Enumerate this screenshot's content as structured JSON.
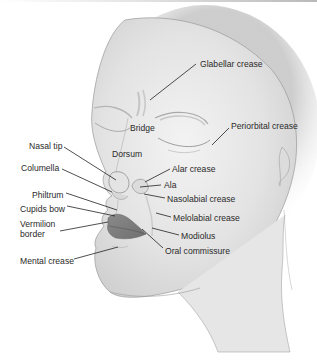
{
  "figure": {
    "labels": [
      {
        "id": "glabellar_crease",
        "text": "Glabellar crease",
        "x": 200,
        "y": 59,
        "lx1": 196,
        "ly1": 64,
        "lx2": 150,
        "ly2": 100
      },
      {
        "id": "bridge",
        "text": "Bridge",
        "x": 130,
        "y": 123,
        "lx1": null
      },
      {
        "id": "periorbital_crease",
        "text": "Periorbital crease",
        "x": 231,
        "y": 121,
        "lx1": 229,
        "ly1": 128,
        "lx2": 212,
        "ly2": 145
      },
      {
        "id": "nasal_tip",
        "text": "Nasal tip",
        "x": 29,
        "y": 141,
        "lx1": 64,
        "ly1": 147,
        "lx2": 116,
        "ly2": 180
      },
      {
        "id": "dorsum",
        "text": "Dorsum",
        "x": 112,
        "y": 149,
        "lx1": null
      },
      {
        "id": "columella",
        "text": "Columella",
        "x": 21,
        "y": 163,
        "lx1": 62,
        "ly1": 169,
        "lx2": 112,
        "ly2": 192
      },
      {
        "id": "alar_crease",
        "text": "Alar crease",
        "x": 172,
        "y": 164,
        "lx1": 170,
        "ly1": 169,
        "lx2": 145,
        "ly2": 182
      },
      {
        "id": "ala",
        "text": "Ala",
        "x": 164,
        "y": 180,
        "lx1": 161,
        "ly1": 185,
        "lx2": 140,
        "ly2": 187
      },
      {
        "id": "philtrum",
        "text": "Philtrum",
        "x": 32,
        "y": 190,
        "lx1": 66,
        "ly1": 193,
        "lx2": 117,
        "ly2": 210
      },
      {
        "id": "nasolabial_crease",
        "text": "Nasolabial crease",
        "x": 167,
        "y": 194,
        "lx1": 165,
        "ly1": 198,
        "lx2": 144,
        "ly2": 194
      },
      {
        "id": "cupids_bow",
        "text": "Cupids bow",
        "x": 20,
        "y": 204,
        "lx1": 67,
        "ly1": 206,
        "lx2": 115,
        "ly2": 216
      },
      {
        "id": "vermilion_border",
        "text": "Vermilion\nborder",
        "x": 20,
        "y": 219,
        "lx1": 60,
        "ly1": 231,
        "lx2": 108,
        "ly2": 222
      },
      {
        "id": "melolabial_crease",
        "text": "Melolabial crease",
        "x": 173,
        "y": 213,
        "lx1": 171,
        "ly1": 217,
        "lx2": 156,
        "ly2": 213
      },
      {
        "id": "modiolus",
        "text": "Modiolus",
        "x": 181,
        "y": 231,
        "lx1": 179,
        "ly1": 235,
        "lx2": 152,
        "ly2": 228
      },
      {
        "id": "oral_commissure",
        "text": "Oral commissure",
        "x": 165,
        "y": 246,
        "lx1": 163,
        "ly1": 248,
        "lx2": 142,
        "ly2": 229
      },
      {
        "id": "mental_crease",
        "text": "Mental crease",
        "x": 20,
        "y": 256,
        "lx1": 74,
        "ly1": 259,
        "lx2": 118,
        "ly2": 247
      }
    ]
  }
}
